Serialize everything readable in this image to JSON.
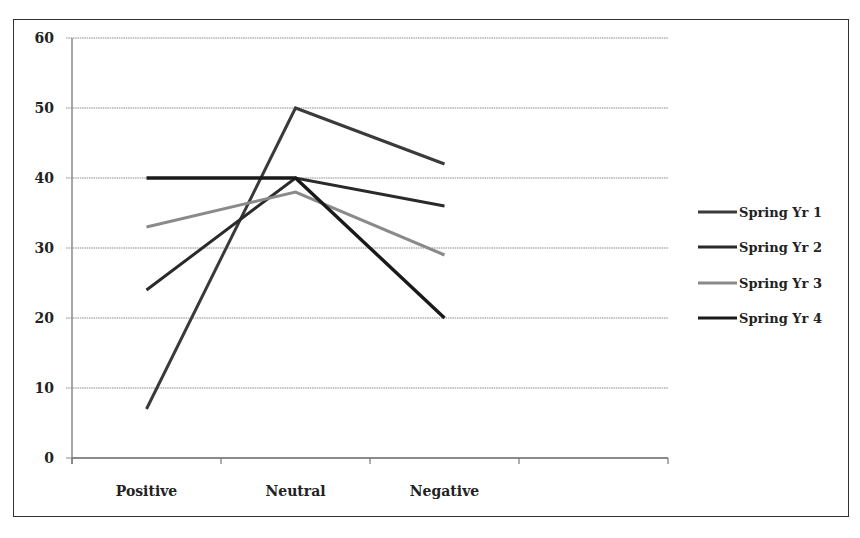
{
  "chart_data": {
    "type": "line",
    "title": "",
    "xlabel": "",
    "ylabel": "",
    "categories": [
      "Positive",
      "Neutral",
      "Negative"
    ],
    "x_slots": 4,
    "ylim": [
      0,
      60
    ],
    "yticks": [
      0,
      10,
      20,
      30,
      40,
      50,
      60
    ],
    "grid": true,
    "legend_position": "right",
    "series": [
      {
        "name": "Spring Yr 1",
        "values": [
          7,
          50,
          42
        ],
        "color": "#3a3a3a"
      },
      {
        "name": "Spring Yr 2",
        "values": [
          24,
          40,
          36
        ],
        "color": "#2a2a2a"
      },
      {
        "name": "Spring Yr 3",
        "values": [
          33,
          38,
          29
        ],
        "color": "#8a8a8a"
      },
      {
        "name": "Spring Yr 4",
        "values": [
          40,
          40,
          20
        ],
        "color": "#1a1a1a"
      }
    ]
  }
}
